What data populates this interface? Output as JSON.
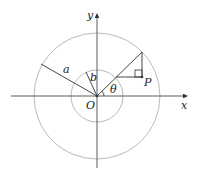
{
  "diagram": {
    "labels": {
      "y_axis": "y",
      "x_axis": "x",
      "origin": "O",
      "outer_radius": "a",
      "inner_radius": "b",
      "angle": "θ",
      "point": "P"
    },
    "colors": {
      "circle": "#bbbbbb",
      "line": "#333333"
    }
  }
}
